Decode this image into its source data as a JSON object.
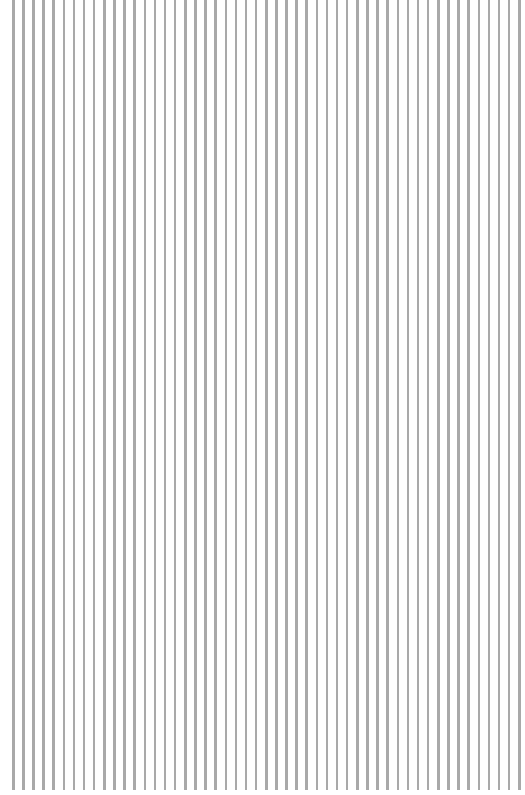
{
  "pattern": {
    "type": "vertical-stripes",
    "line_count": 51,
    "first_x": 12,
    "pitch": 10.12,
    "line_width": 2.5,
    "line_height": 790,
    "line_color": "#a9a9a9",
    "background_color": "#ffffff"
  }
}
